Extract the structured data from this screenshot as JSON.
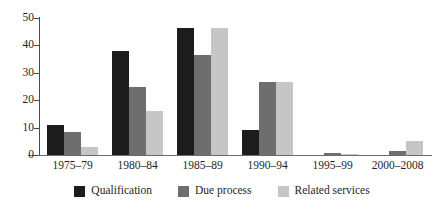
{
  "chart_data": {
    "type": "bar",
    "title": "",
    "subtitle": "",
    "xlabel": "",
    "ylabel": "",
    "ylim": [
      0,
      50
    ],
    "yticks": [
      0,
      10,
      20,
      30,
      40,
      50
    ],
    "ytick_labels": [
      "0",
      "10",
      "20",
      "30",
      "40",
      "50"
    ],
    "grid": false,
    "legend_position": "bottom",
    "orientation": "vertical",
    "grouped": true,
    "categories": [
      "1975–79",
      "1980–84",
      "1985–89",
      "1990–94",
      "1995–99",
      "2000–2008"
    ],
    "series": [
      {
        "name": "Qualification",
        "color": "#1c1c1c",
        "values": [
          11,
          38,
          46.5,
          9,
          0,
          0
        ]
      },
      {
        "name": "Due process",
        "color": "#6e6e6e",
        "values": [
          8.5,
          25,
          36.5,
          26.5,
          0.6,
          1.5
        ]
      },
      {
        "name": "Related services",
        "color": "#c6c6c6",
        "values": [
          3,
          16,
          46.5,
          26.5,
          0.5,
          5
        ]
      }
    ],
    "axis_color": "#4a4a4a",
    "background": "#ffffff"
  }
}
